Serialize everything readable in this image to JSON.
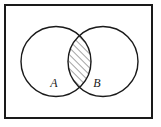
{
  "figure": {
    "name": "venn-diagram-intersection",
    "type": "set-diagram",
    "shaded_region": "A ∩ B",
    "background_color": "#ffffff",
    "stroke_color": "#1a1a1a",
    "hatch_color": "#333333"
  },
  "universe_rect": {
    "label": "",
    "x": 5,
    "y": 5,
    "width": 147,
    "height": 113,
    "stroke_width": 2
  },
  "sets": [
    {
      "id": "A",
      "label": "A",
      "cx": 56,
      "cy": 61.5,
      "r": 35,
      "label_x": 54,
      "label_y": 87
    },
    {
      "id": "B",
      "label": "B",
      "cx": 103,
      "cy": 61.5,
      "r": 35,
      "label_x": 97,
      "label_y": 87
    }
  ],
  "hatching": {
    "angle_degrees": 45,
    "direction": "lower-left to upper-right",
    "spacing_px": 3.5,
    "line_width": 0.9
  },
  "chart_data": {
    "type": "venn",
    "title": "",
    "sets": [
      "A",
      "B"
    ],
    "set_labels": [
      "A",
      "B"
    ],
    "shaded": [
      "A ∩ B"
    ],
    "regions": [
      {
        "name": "A only",
        "shaded": false
      },
      {
        "name": "B only",
        "shaded": false
      },
      {
        "name": "A ∩ B",
        "shaded": true
      },
      {
        "name": "outside A ∪ B",
        "shaded": false
      }
    ],
    "legend": "none",
    "grid": false
  }
}
